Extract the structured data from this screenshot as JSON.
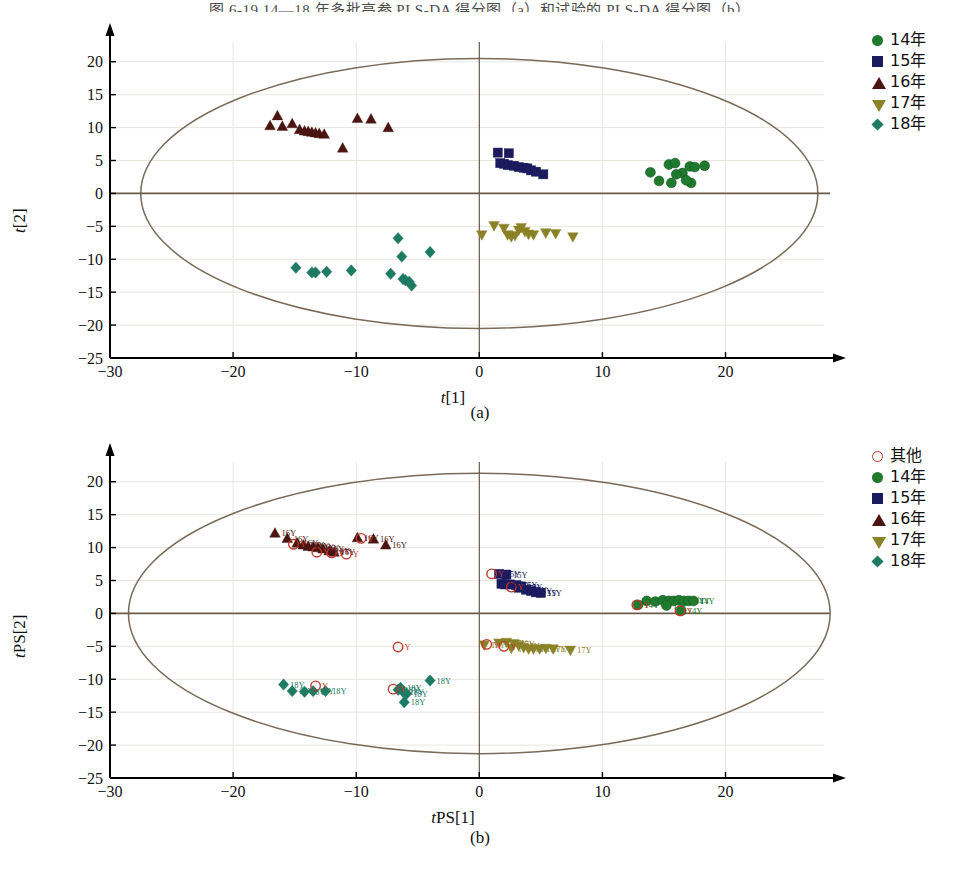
{
  "figure": {
    "top_caption": "图 6-19   14—18 年多批高参 PLS-DA 得分图（a）和试验的 PLS-DA 得分图（b）",
    "panel_a_caption": "(a)",
    "panel_b_caption": "(b)"
  },
  "colors": {
    "green": "#1f7a2e",
    "navy": "#1b1b5e",
    "maroon": "#4a1410",
    "olive": "#8a8227",
    "teal": "#1d7a63",
    "other_open": "#c0392b",
    "ellipse": "#7a6a5a",
    "axis": "#000000",
    "grid": "#e9e6e0",
    "zero_line": "#6b5b4b"
  },
  "legend_a": {
    "items": [
      {
        "label": "14年",
        "marker": "circle",
        "color": "#1f7a2e"
      },
      {
        "label": "15年",
        "marker": "square",
        "color": "#1b1b5e"
      },
      {
        "label": "16年",
        "marker": "triangle-up",
        "color": "#4a1410"
      },
      {
        "label": "17年",
        "marker": "triangle-down",
        "color": "#8a8227"
      },
      {
        "label": "18年",
        "marker": "diamond",
        "color": "#1d7a63"
      }
    ]
  },
  "legend_b": {
    "items": [
      {
        "label": "其他",
        "marker": "open-circle",
        "color": "#c0392b"
      },
      {
        "label": "14年",
        "marker": "circle",
        "color": "#1f7a2e"
      },
      {
        "label": "15年",
        "marker": "square",
        "color": "#1b1b5e"
      },
      {
        "label": "16年",
        "marker": "triangle-up",
        "color": "#4a1410"
      },
      {
        "label": "17年",
        "marker": "triangle-down",
        "color": "#8a8227"
      },
      {
        "label": "18年",
        "marker": "diamond",
        "color": "#1d7a63"
      }
    ]
  },
  "chart_data": [
    {
      "type": "scatter",
      "panel": "a",
      "title": "",
      "xlabel": "t[1]",
      "ylabel": "t[2]",
      "xlim": [
        -30,
        28
      ],
      "ylim": [
        -25,
        23
      ],
      "xticks": [
        -30,
        -20,
        -10,
        0,
        10,
        20
      ],
      "yticks": [
        -25,
        -20,
        -15,
        -10,
        -5,
        0,
        5,
        10,
        15,
        20
      ],
      "grid": true,
      "legend_position": "right-top",
      "confidence_ellipse": {
        "cx": 0,
        "cy": 0,
        "rx": 27.5,
        "ry": 20.5
      },
      "series": [
        {
          "name": "14年",
          "marker": "circle",
          "color": "#1f7a2e",
          "points": [
            [
              13.9,
              3.2
            ],
            [
              14.6,
              1.9
            ],
            [
              15.4,
              4.4
            ],
            [
              15.9,
              4.6
            ],
            [
              15.6,
              1.6
            ],
            [
              16.5,
              3.1
            ],
            [
              17.1,
              4.1
            ],
            [
              17.5,
              4.0
            ],
            [
              17.2,
              1.6
            ],
            [
              18.3,
              4.2
            ],
            [
              16.0,
              2.9
            ],
            [
              16.8,
              2.0
            ]
          ]
        },
        {
          "name": "15年",
          "marker": "square",
          "color": "#1b1b5e",
          "points": [
            [
              1.5,
              6.2
            ],
            [
              2.4,
              6.1
            ],
            [
              1.7,
              4.6
            ],
            [
              2.3,
              4.3
            ],
            [
              2.8,
              4.2
            ],
            [
              3.2,
              4.0
            ],
            [
              3.6,
              3.9
            ],
            [
              3.9,
              3.8
            ],
            [
              4.2,
              3.5
            ],
            [
              4.6,
              3.3
            ],
            [
              5.2,
              2.9
            ],
            [
              2.0,
              4.5
            ]
          ]
        },
        {
          "name": "16年",
          "marker": "triangle-up",
          "color": "#4a1410",
          "points": [
            [
              -16.4,
              11.8
            ],
            [
              -17.0,
              10.3
            ],
            [
              -16.0,
              10.2
            ],
            [
              -15.2,
              10.6
            ],
            [
              -14.6,
              9.7
            ],
            [
              -14.2,
              9.5
            ],
            [
              -13.9,
              9.4
            ],
            [
              -13.6,
              9.3
            ],
            [
              -13.3,
              9.2
            ],
            [
              -13.0,
              9.1
            ],
            [
              -12.6,
              9.0
            ],
            [
              -11.1,
              6.9
            ],
            [
              -9.9,
              11.4
            ],
            [
              -8.8,
              11.3
            ],
            [
              -7.4,
              10.0
            ]
          ]
        },
        {
          "name": "17年",
          "marker": "triangle-down",
          "color": "#8a8227",
          "points": [
            [
              0.2,
              -6.3
            ],
            [
              1.2,
              -4.9
            ],
            [
              2.0,
              -5.3
            ],
            [
              2.3,
              -6.3
            ],
            [
              2.6,
              -6.6
            ],
            [
              2.9,
              -6.4
            ],
            [
              3.2,
              -5.6
            ],
            [
              3.4,
              -5.2
            ],
            [
              3.7,
              -5.8
            ],
            [
              4.0,
              -6.2
            ],
            [
              4.4,
              -6.3
            ],
            [
              5.4,
              -6.0
            ],
            [
              6.2,
              -6.1
            ],
            [
              7.6,
              -6.6
            ]
          ]
        },
        {
          "name": "18年",
          "marker": "diamond",
          "color": "#1d7a63",
          "points": [
            [
              -14.9,
              -11.3
            ],
            [
              -13.6,
              -12.0
            ],
            [
              -13.3,
              -12.0
            ],
            [
              -12.4,
              -11.9
            ],
            [
              -10.4,
              -11.7
            ],
            [
              -7.2,
              -12.2
            ],
            [
              -6.6,
              -6.8
            ],
            [
              -6.2,
              -13.0
            ],
            [
              -6.0,
              -13.2
            ],
            [
              -5.7,
              -13.4
            ],
            [
              -5.5,
              -14.0
            ],
            [
              -6.3,
              -9.6
            ],
            [
              -4.0,
              -8.9
            ]
          ]
        }
      ]
    },
    {
      "type": "scatter",
      "panel": "b",
      "title": "",
      "xlabel": "tPS[1]",
      "ylabel": "tPS[2]",
      "xlim": [
        -30,
        28
      ],
      "ylim": [
        -25,
        23
      ],
      "xticks": [
        -30,
        -20,
        -10,
        0,
        10,
        20
      ],
      "yticks": [
        -25,
        -20,
        -15,
        -10,
        -5,
        0,
        5,
        10,
        15,
        20
      ],
      "grid": true,
      "legend_position": "right-top",
      "confidence_ellipse": {
        "cx": 0,
        "cy": 0,
        "rx": 28.5,
        "ry": 21.3
      },
      "point_label_suffix": "Y",
      "series": [
        {
          "name": "14年",
          "marker": "circle",
          "color": "#1f7a2e",
          "label": "14Y",
          "points": [
            [
              13.6,
              1.9
            ],
            [
              14.3,
              1.8
            ],
            [
              14.9,
              2.0
            ],
            [
              15.4,
              1.9
            ],
            [
              15.8,
              1.9
            ],
            [
              16.2,
              2.0
            ],
            [
              16.6,
              1.9
            ],
            [
              17.0,
              1.9
            ],
            [
              17.4,
              1.9
            ],
            [
              12.9,
              1.3
            ],
            [
              16.4,
              0.4
            ],
            [
              15.2,
              1.2
            ]
          ]
        },
        {
          "name": "15年",
          "marker": "square",
          "color": "#1b1b5e",
          "label": "15Y",
          "points": [
            [
              1.6,
              6.0
            ],
            [
              2.2,
              5.9
            ],
            [
              1.8,
              4.5
            ],
            [
              2.5,
              4.4
            ],
            [
              3.0,
              4.3
            ],
            [
              3.4,
              4.1
            ],
            [
              3.8,
              3.6
            ],
            [
              4.2,
              3.4
            ],
            [
              4.6,
              3.2
            ],
            [
              5.0,
              3.1
            ],
            [
              2.1,
              4.4
            ],
            [
              3.2,
              3.9
            ]
          ]
        },
        {
          "name": "16年",
          "marker": "triangle-up",
          "color": "#4a1410",
          "label": "16Y",
          "points": [
            [
              -16.6,
              12.2
            ],
            [
              -15.6,
              11.4
            ],
            [
              -14.8,
              10.7
            ],
            [
              -14.3,
              10.4
            ],
            [
              -13.9,
              10.2
            ],
            [
              -13.5,
              10.1
            ],
            [
              -13.1,
              10.0
            ],
            [
              -12.7,
              9.8
            ],
            [
              -12.2,
              9.5
            ],
            [
              -11.8,
              9.3
            ],
            [
              -9.9,
              11.5
            ],
            [
              -8.6,
              11.3
            ],
            [
              -7.6,
              10.4
            ]
          ]
        },
        {
          "name": "17年",
          "marker": "triangle-down",
          "color": "#8a8227",
          "label": "17Y",
          "points": [
            [
              0.4,
              -4.8
            ],
            [
              1.6,
              -4.5
            ],
            [
              2.2,
              -4.4
            ],
            [
              2.8,
              -4.6
            ],
            [
              3.2,
              -4.9
            ],
            [
              3.6,
              -5.2
            ],
            [
              4.0,
              -5.4
            ],
            [
              4.4,
              -5.4
            ],
            [
              4.9,
              -5.4
            ],
            [
              5.4,
              -5.3
            ],
            [
              6.0,
              -5.4
            ],
            [
              7.4,
              -5.6
            ],
            [
              2.6,
              -5.3
            ]
          ]
        },
        {
          "name": "18年",
          "marker": "diamond",
          "color": "#1d7a63",
          "label": "18Y",
          "points": [
            [
              -15.9,
              -10.8
            ],
            [
              -15.2,
              -11.8
            ],
            [
              -14.2,
              -11.9
            ],
            [
              -13.5,
              -11.8
            ],
            [
              -12.5,
              -11.8
            ],
            [
              -6.6,
              -11.6
            ],
            [
              -6.2,
              -11.9
            ],
            [
              -5.9,
              -12.2
            ],
            [
              -6.1,
              -13.5
            ],
            [
              -4.0,
              -10.2
            ],
            [
              -6.4,
              -11.3
            ]
          ]
        },
        {
          "name": "其他",
          "marker": "open-circle",
          "color": "#c0392b",
          "label": "Y",
          "points": [
            [
              -15.1,
              10.5
            ],
            [
              -13.2,
              9.3
            ],
            [
              -12.0,
              9.2
            ],
            [
              -10.8,
              9.0
            ],
            [
              -9.6,
              11.4
            ],
            [
              1.0,
              6.0
            ],
            [
              2.6,
              4.0
            ],
            [
              0.6,
              -4.7
            ],
            [
              2.0,
              -5.0
            ],
            [
              12.8,
              1.3
            ],
            [
              16.3,
              0.4
            ],
            [
              -13.3,
              -11.0
            ],
            [
              -7.0,
              -11.5
            ],
            [
              -6.6,
              -5.1
            ]
          ]
        }
      ]
    }
  ]
}
